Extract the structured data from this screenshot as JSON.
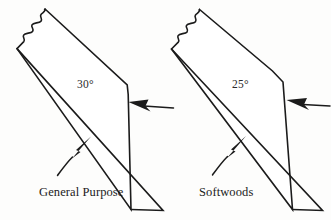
{
  "figure": {
    "background_color": "#fdfdfc",
    "stroke_color": "#1b1b1b"
  },
  "blades": [
    {
      "id": "general-purpose",
      "angle_label": "30°",
      "caption": "General Purpose",
      "angle_value": 30,
      "break_edge": "wavy-break-line",
      "annotations": [
        {
          "name": "primary-bevel-arrow",
          "points_to": "primary bevel facet",
          "direction": "left"
        },
        {
          "name": "back-face-arrow",
          "points_to": "flat back of blade",
          "direction": "up-right"
        }
      ]
    },
    {
      "id": "softwoods",
      "angle_label": "25°",
      "caption": "Softwoods",
      "angle_value": 25,
      "break_edge": "wavy-break-line",
      "annotations": [
        {
          "name": "primary-bevel-arrow",
          "points_to": "primary bevel facet",
          "direction": "left"
        },
        {
          "name": "back-face-arrow",
          "points_to": "flat back of blade",
          "direction": "up-right"
        }
      ]
    }
  ]
}
